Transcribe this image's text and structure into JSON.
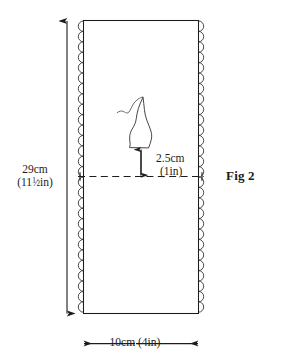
{
  "figure": {
    "caption": "Fig 2",
    "shape": "rectangle-fabric-panel",
    "colors": {
      "line": "#1c1c1c",
      "fill": "#ffffff",
      "text": "#1a1a1a"
    },
    "labels": {
      "height": {
        "metric": "29cm",
        "imperial_whole": "11",
        "imperial_numerator": "1",
        "imperial_denominator": "2",
        "imperial_unit": "in",
        "imperial_full": "(11½in)"
      },
      "width": {
        "text": "10cm (4in)",
        "metric": "10cm",
        "imperial": "(4in)"
      },
      "motif_offset": {
        "metric": "2.5cm",
        "imperial": "(1in)"
      }
    },
    "elements": [
      {
        "name": "fabric-panel",
        "type": "rectangle"
      },
      {
        "name": "scalloped-left-edge",
        "type": "decorative-edge"
      },
      {
        "name": "scalloped-right-edge",
        "type": "decorative-edge"
      },
      {
        "name": "leaf-motif",
        "type": "applique-shape"
      },
      {
        "name": "stem-squiggle",
        "type": "applique-shape"
      },
      {
        "name": "fold-dashed-line",
        "type": "guideline"
      },
      {
        "name": "height-dimension-arrow",
        "type": "dimension"
      },
      {
        "name": "width-dimension-arrow",
        "type": "dimension"
      },
      {
        "name": "motif-offset-arrow",
        "type": "dimension"
      }
    ]
  }
}
